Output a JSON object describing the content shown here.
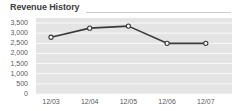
{
  "widget": {
    "title": "Revenue History"
  },
  "chart_data": {
    "type": "line",
    "title": "Revenue History",
    "categories": [
      "12/03",
      "12/04",
      "12/05",
      "12/06",
      "12/07"
    ],
    "values": [
      2800,
      3250,
      3350,
      2500,
      2500
    ],
    "xlabel": "",
    "ylabel": "",
    "ylim": [
      0,
      3750
    ],
    "ytick_interval": 500,
    "ytick_labels_bottom_to_top": [
      "0",
      "500",
      "1,000",
      "1,500",
      "2,000",
      "2,500",
      "3,000",
      "3,500"
    ],
    "grid": "horizontal gridlines over gray bands",
    "legend": "none",
    "colors": {
      "line": "#3a3a3a",
      "marker_fill": "#ffffff",
      "marker_stroke": "#3a3a3a",
      "plot_band": "#e4e4e4",
      "gridline": "#fafafa",
      "axis_text": "#5a5a5a",
      "title_text": "#3d3d3d",
      "divider": "#cccccc",
      "background": "#ffffff"
    }
  }
}
